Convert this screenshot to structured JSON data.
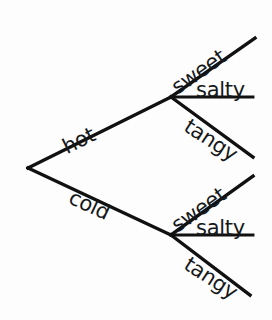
{
  "diagram": {
    "type": "tree-diagram",
    "title": "",
    "background_color": "#fdfdfd",
    "line_color": "#111111",
    "text_color": "#16181a",
    "root": {
      "name": "root-node",
      "x": 28,
      "y": 168
    },
    "level1": [
      {
        "id": "hot",
        "label": "hot",
        "node_x": 171,
        "node_y": 97,
        "label_x": 64,
        "label_y": 138,
        "rotation": -26.4,
        "direction": "up"
      },
      {
        "id": "cold",
        "label": "cold",
        "node_x": 171,
        "node_y": 235,
        "label_x": 70,
        "label_y": 186,
        "rotation": 25.2,
        "direction": "down"
      }
    ],
    "level2": [
      {
        "id": "hot-sweet",
        "parent": "hot",
        "label": "sweet",
        "end_x": 255,
        "end_y": 38,
        "label_x": 174,
        "label_y": 79,
        "rotation": -35.0,
        "direction": "up"
      },
      {
        "id": "hot-salty",
        "parent": "hot",
        "label": "salty",
        "end_x": 253,
        "end_y": 97,
        "label_x": 196,
        "label_y": 80,
        "rotation": 0,
        "direction": "flat"
      },
      {
        "id": "hot-tangy",
        "parent": "hot",
        "label": "tangy",
        "end_x": 253,
        "end_y": 157,
        "label_x": 186,
        "label_y": 114,
        "rotation": 33.0,
        "direction": "down"
      },
      {
        "id": "cold-sweet",
        "parent": "cold",
        "label": "sweet",
        "end_x": 253,
        "end_y": 176,
        "label_x": 174,
        "label_y": 217,
        "rotation": -35.0,
        "direction": "up"
      },
      {
        "id": "cold-salty",
        "parent": "cold",
        "label": "salty",
        "end_x": 253,
        "end_y": 235,
        "label_x": 196,
        "label_y": 218,
        "rotation": 0,
        "direction": "flat"
      },
      {
        "id": "cold-tangy",
        "parent": "cold",
        "label": "tangy",
        "end_x": 250,
        "end_y": 295,
        "label_x": 186,
        "label_y": 252,
        "rotation": 33.0,
        "direction": "down"
      }
    ]
  }
}
